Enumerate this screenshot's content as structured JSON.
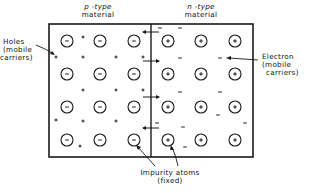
{
  "labels": {
    "p_type_line1": "p -type",
    "p_type_line2": "material",
    "n_type_line1": "n -type",
    "n_type_line2": "material",
    "holes_line1": "Holes",
    "holes_line2": "(mobile",
    "holes_line3": "carriers)",
    "electron_line1": "Electron",
    "electron_line2": "(mobile",
    "electron_line3": "carriers)",
    "impurity_line1": "Impurity atoms",
    "impurity_line2": "(fixed)"
  },
  "diagram": {
    "box": {
      "x": 49,
      "y": 24,
      "width": 204,
      "height": 133
    },
    "junction_x": 151,
    "p_region": {
      "ion_symbol": "−",
      "ion_columns_x": [
        67,
        100,
        134
      ],
      "ion_rows_y": [
        41,
        74,
        107,
        140
      ],
      "holes": [
        [
          83,
          37
        ],
        [
          56,
          57
        ],
        [
          83,
          57
        ],
        [
          116,
          57
        ],
        [
          143,
          57
        ],
        [
          83,
          90
        ],
        [
          116,
          90
        ],
        [
          143,
          90
        ],
        [
          56,
          120
        ],
        [
          83,
          121
        ],
        [
          116,
          121
        ],
        [
          80,
          146
        ]
      ]
    },
    "n_region": {
      "ion_symbol": "+",
      "ion_columns_x": [
        168,
        201,
        235
      ],
      "ion_rows_y": [
        41,
        74,
        107,
        140
      ],
      "electrons": [
        [
          160,
          28
        ],
        [
          180,
          28
        ],
        [
          180,
          58
        ],
        [
          220,
          58
        ],
        [
          180,
          92
        ],
        [
          220,
          92
        ],
        [
          218,
          115
        ],
        [
          245,
          123
        ],
        [
          157,
          123
        ],
        [
          183,
          127
        ],
        [
          185,
          147
        ]
      ]
    },
    "junction_arrows": [
      {
        "y": 32,
        "direction": "left"
      },
      {
        "y": 61,
        "direction": "right"
      },
      {
        "y": 97,
        "direction": "right"
      },
      {
        "y": 128,
        "direction": "left"
      }
    ],
    "ion_radius": 6,
    "stroke_color": "#1a1a1a"
  }
}
